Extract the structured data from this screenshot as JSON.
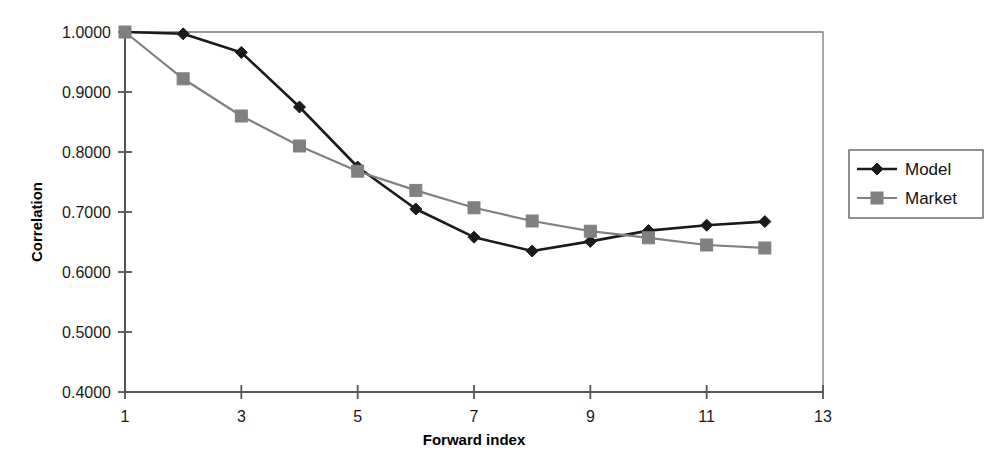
{
  "chart_data": {
    "type": "line",
    "title": "",
    "xlabel": "Forward index",
    "ylabel": "Correlation",
    "x": [
      1,
      2,
      3,
      4,
      5,
      6,
      7,
      8,
      9,
      10,
      11,
      12
    ],
    "xlim": [
      1,
      13
    ],
    "ylim": [
      0.4,
      1.0
    ],
    "xticks": [
      1,
      3,
      5,
      7,
      9,
      11,
      13
    ],
    "xtick_labels": [
      "1",
      "3",
      "5",
      "7",
      "9",
      "11",
      "13"
    ],
    "yticks": [
      0.4,
      0.5,
      0.6,
      0.7,
      0.8,
      0.9,
      1.0
    ],
    "ytick_labels": [
      "0.4000",
      "0.5000",
      "0.6000",
      "0.7000",
      "0.8000",
      "0.9000",
      "1.0000"
    ],
    "grid": false,
    "legend_position": "right-outside",
    "series": [
      {
        "name": "Model",
        "marker": "diamond",
        "color": "#1a1a1a",
        "values": [
          1.0,
          0.997,
          0.966,
          0.875,
          0.775,
          0.705,
          0.658,
          0.635,
          0.651,
          0.669,
          0.678,
          0.684
        ]
      },
      {
        "name": "Market",
        "marker": "square",
        "color": "#808080",
        "values": [
          1.0,
          0.922,
          0.86,
          0.81,
          0.768,
          0.736,
          0.707,
          0.685,
          0.668,
          0.657,
          0.645,
          0.64
        ]
      }
    ]
  },
  "legend": {
    "entries": [
      {
        "label": "Model"
      },
      {
        "label": "Market"
      }
    ]
  },
  "colors": {
    "model": "#1a1a1a",
    "market": "#808080",
    "axis": "#555555",
    "frame": "#777777",
    "background": "#ffffff"
  }
}
